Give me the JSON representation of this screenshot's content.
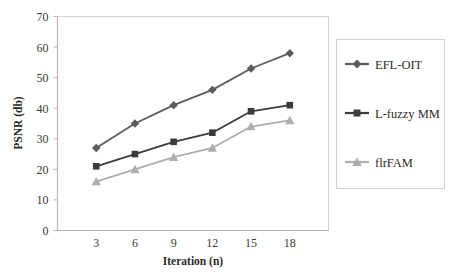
{
  "chart_data": {
    "type": "line",
    "title": "",
    "xlabel": "Iteration (n)",
    "ylabel": "PSNR (db)",
    "x": [
      3,
      6,
      9,
      12,
      15,
      18
    ],
    "categories": [
      "3",
      "6",
      "9",
      "12",
      "15",
      "18"
    ],
    "xlim": [
      0,
      21
    ],
    "ylim": [
      0,
      70
    ],
    "ytick_labels": [
      "0",
      "10",
      "20",
      "30",
      "40",
      "50",
      "60",
      "70"
    ],
    "yticks": [
      0,
      10,
      20,
      30,
      40,
      50,
      60,
      70
    ],
    "grid": false,
    "legend_position": "right-outside",
    "series": [
      {
        "name": "EFL-OIT",
        "marker": "diamond",
        "color": "#5c5c5c",
        "values": [
          27,
          35,
          41,
          46,
          53,
          58
        ]
      },
      {
        "name": "L-fuzzy MM",
        "marker": "square",
        "color": "#3b3b3b",
        "values": [
          21,
          25,
          29,
          32,
          39,
          41
        ]
      },
      {
        "name": "flrFAM",
        "marker": "triangle",
        "color": "#adadad",
        "values": [
          16,
          20,
          24,
          27,
          34,
          36
        ]
      }
    ]
  },
  "legend": {
    "entries": [
      {
        "label": "EFL-OIT"
      },
      {
        "label": "L-fuzzy MM"
      },
      {
        "label": "flrFAM"
      }
    ]
  },
  "colors": {
    "axis_line": "#c9c9c9",
    "plot_border": "#d2d2d2",
    "legend_border": "#cfcfcf",
    "background": "#ffffff",
    "tick_text": "#3a3a3a"
  }
}
